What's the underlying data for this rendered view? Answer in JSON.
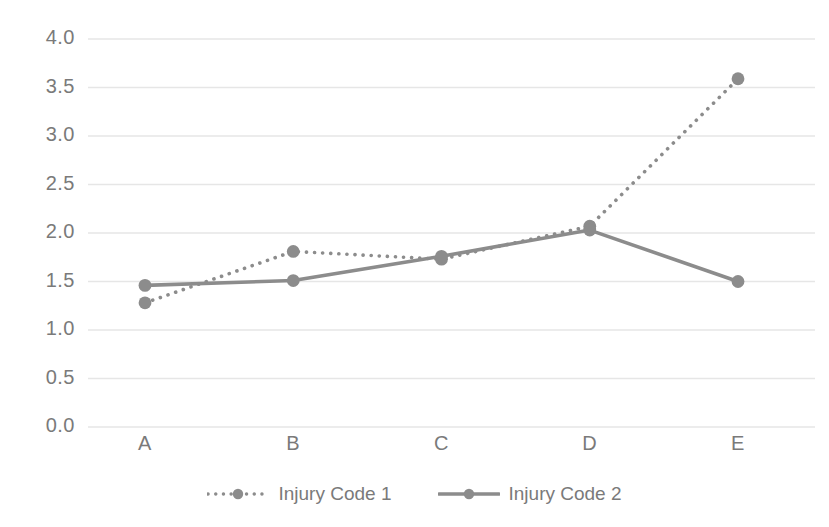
{
  "chart_data": {
    "type": "line",
    "title": "",
    "subtitle": "",
    "xlabel": "",
    "ylabel": "",
    "categories": [
      "A",
      "B",
      "C",
      "D",
      "E"
    ],
    "series": [
      {
        "name": "Injury Code 1",
        "style": "dotted",
        "color": "#8c8c8c",
        "marker": "circle",
        "values": [
          1.28,
          1.81,
          1.73,
          2.07,
          3.59
        ]
      },
      {
        "name": "Injury Code 2",
        "style": "solid",
        "color": "#8c8c8c",
        "marker": "circle",
        "values": [
          1.46,
          1.51,
          1.76,
          2.03,
          1.5
        ]
      }
    ],
    "ylim": [
      0.0,
      4.0
    ],
    "yticks": [
      "0.0",
      "0.5",
      "1.0",
      "1.5",
      "2.0",
      "2.5",
      "3.0",
      "3.5",
      "4.0"
    ],
    "ytick_values": [
      0.0,
      0.5,
      1.0,
      1.5,
      2.0,
      2.5,
      3.0,
      3.5,
      4.0
    ],
    "grid": true,
    "grid_color": "#e6e6e6",
    "legend_position": "bottom",
    "axis_text_color": "#7a7a7a",
    "background": "#ffffff"
  },
  "legend": {
    "entries": [
      {
        "label": "Injury Code 1"
      },
      {
        "label": "Injury Code 2"
      }
    ]
  }
}
